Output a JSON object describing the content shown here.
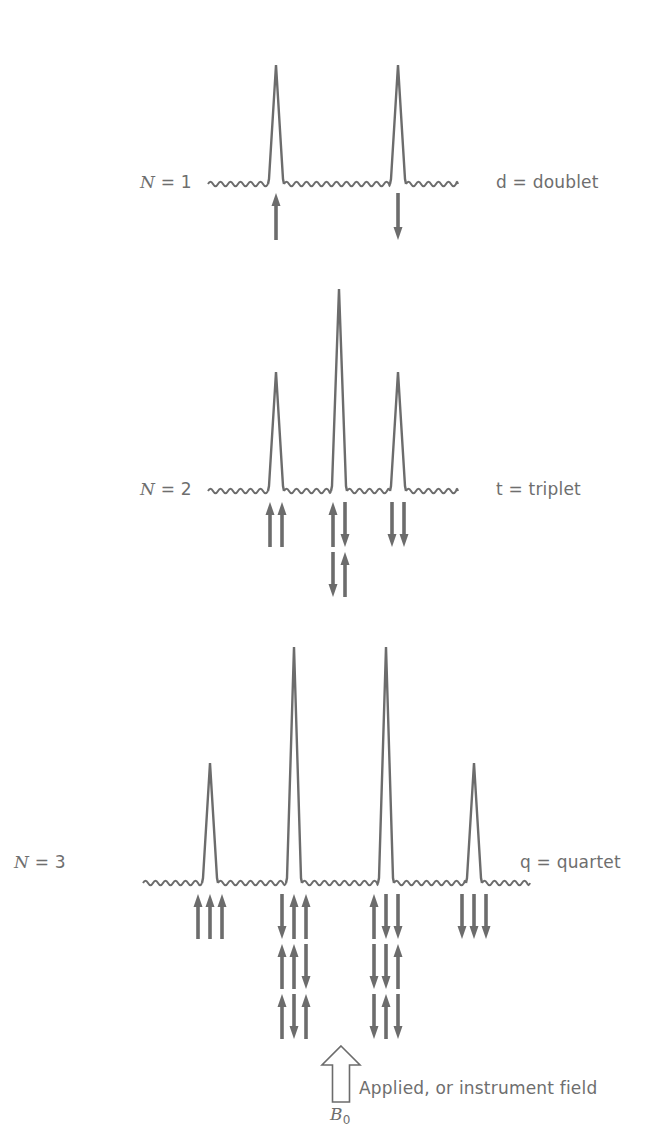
{
  "colors": {
    "stroke": "#6c6c6c",
    "text": "#6e6e6e",
    "background": "#ffffff"
  },
  "chart_data": {
    "type": "diagram",
    "multiplets": [
      {
        "n_label": "N = 1",
        "n_var": "N",
        "n_value": "1",
        "name_label": "d = doublet",
        "baseline_y": 183,
        "baseline_x": [
          208,
          458
        ],
        "label_pos": {
          "n": [
            140,
            172
          ],
          "name": [
            496,
            172
          ]
        },
        "peaks": [
          {
            "x": 276,
            "top": 65,
            "rel_intensity": 1,
            "states": [
              [
                "up"
              ]
            ]
          },
          {
            "x": 398,
            "top": 65,
            "rel_intensity": 1,
            "states": [
              [
                "down"
              ]
            ]
          }
        ]
      },
      {
        "n_label": "N = 2",
        "n_var": "N",
        "n_value": "2",
        "name_label": "t = triplet",
        "baseline_y": 490,
        "baseline_x": [
          208,
          458
        ],
        "label_pos": {
          "n": [
            140,
            479
          ],
          "name": [
            496,
            479
          ]
        },
        "peaks": [
          {
            "x": 276,
            "top": 372,
            "rel_intensity": 1,
            "states": [
              [
                "up",
                "up"
              ]
            ]
          },
          {
            "x": 339,
            "top": 289,
            "rel_intensity": 2,
            "states": [
              [
                "up",
                "down"
              ],
              [
                "down",
                "up"
              ]
            ]
          },
          {
            "x": 398,
            "top": 372,
            "rel_intensity": 1,
            "states": [
              [
                "down",
                "down"
              ]
            ]
          }
        ]
      },
      {
        "n_label": "N = 3",
        "n_var": "N",
        "n_value": "3",
        "name_label": "q = quartet",
        "baseline_y": 882,
        "baseline_x": [
          143,
          530
        ],
        "label_pos": {
          "n": [
            14,
            852
          ],
          "name": [
            520,
            852
          ]
        },
        "peaks": [
          {
            "x": 210,
            "top": 763,
            "rel_intensity": 1,
            "states": [
              [
                "up",
                "up",
                "up"
              ]
            ]
          },
          {
            "x": 294,
            "top": 647,
            "rel_intensity": 3,
            "states": [
              [
                "down",
                "up",
                "up"
              ],
              [
                "up",
                "up",
                "down"
              ],
              [
                "up",
                "down",
                "up"
              ]
            ]
          },
          {
            "x": 386,
            "top": 647,
            "rel_intensity": 3,
            "states": [
              [
                "up",
                "down",
                "down"
              ],
              [
                "down",
                "down",
                "up"
              ],
              [
                "down",
                "up",
                "down"
              ]
            ]
          },
          {
            "x": 474,
            "top": 763,
            "rel_intensity": 1,
            "states": [
              [
                "down",
                "down",
                "down"
              ]
            ]
          }
        ]
      }
    ],
    "field": {
      "symbol": "B",
      "subscript": "0",
      "label": "Applied, or instrument field",
      "arrow_x": 341,
      "arrow_tip_y": 1046,
      "arrow_base_y": 1102
    }
  }
}
